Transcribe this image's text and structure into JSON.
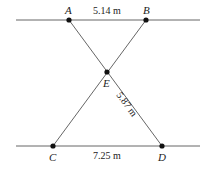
{
  "diagram": {
    "points": {
      "A": {
        "label": "A",
        "x": 69,
        "y": 20
      },
      "B": {
        "label": "B",
        "x": 146,
        "y": 20
      },
      "E": {
        "label": "E",
        "x": 107,
        "y": 72
      },
      "C": {
        "label": "C",
        "x": 53,
        "y": 146
      },
      "D": {
        "label": "D",
        "x": 162,
        "y": 146
      }
    },
    "measurements": {
      "AB": "5.14 m",
      "ED": "5.87 m",
      "CD": "7.25 m"
    }
  }
}
